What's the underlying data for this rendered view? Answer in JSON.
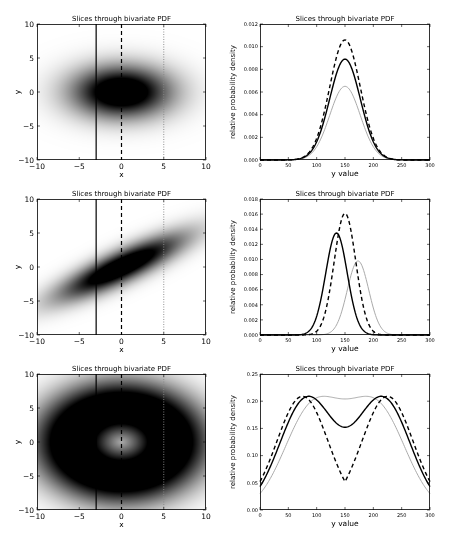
{
  "figure": {
    "width": 453,
    "height": 538,
    "rows": 3
  },
  "chart_data": [
    {
      "type": "heatmap",
      "row": 0,
      "title": "Slices through bivariate PDF",
      "xlabel": "x",
      "ylabel": "y",
      "xlim": [
        -10,
        10
      ],
      "ylim": [
        -10,
        10
      ],
      "xticks": [
        -10,
        -5,
        0,
        5,
        10
      ],
      "yticks": [
        -10,
        -5,
        0,
        5,
        10
      ],
      "distribution": "gaussian",
      "params": {
        "sx": 4.0,
        "sy": 2.6,
        "rho": 0.0
      },
      "slice_lines": [
        {
          "x": -3,
          "style": "solid",
          "color": "#000000"
        },
        {
          "x": 0,
          "style": "dashed",
          "color": "#000000"
        },
        {
          "x": 5,
          "style": "dotted",
          "color": "#888888"
        }
      ]
    },
    {
      "type": "line",
      "row": 0,
      "title": "Slices through bivariate PDF",
      "xlabel": "y value",
      "ylabel": "relative probability density",
      "xlim": [
        0,
        300
      ],
      "ylim": [
        0,
        0.012
      ],
      "xticks": [
        0,
        50,
        100,
        150,
        200,
        250,
        300
      ],
      "yticks": [
        0.0,
        0.002,
        0.004,
        0.006,
        0.008,
        0.01,
        0.012
      ],
      "ytick_labels": [
        "0.000",
        "0.002",
        "0.004",
        "0.006",
        "0.008",
        "0.010",
        "0.012"
      ],
      "series": [
        {
          "name": "slice x=-3",
          "style": "solid",
          "color": "#000000",
          "shape": "gauss",
          "peak": 0.0089,
          "center": 150,
          "sigma": 27
        },
        {
          "name": "slice x=0",
          "style": "dashed",
          "color": "#000000",
          "shape": "gauss",
          "peak": 0.0106,
          "center": 150,
          "sigma": 27
        },
        {
          "name": "slice x=5",
          "style": "solid",
          "color": "#aaaaaa",
          "shape": "gauss",
          "peak": 0.0065,
          "center": 150,
          "sigma": 27
        }
      ]
    },
    {
      "type": "heatmap",
      "row": 1,
      "title": "Slices through bivariate PDF",
      "xlabel": "x",
      "ylabel": "y",
      "xlim": [
        -10,
        10
      ],
      "ylim": [
        -10,
        10
      ],
      "xticks": [
        -10,
        -5,
        0,
        5,
        10
      ],
      "yticks": [
        -10,
        -5,
        0,
        5,
        10
      ],
      "distribution": "gaussian",
      "params": {
        "sx": 5.0,
        "sy": 3.2,
        "rho": 0.85
      },
      "slice_lines": [
        {
          "x": -3,
          "style": "solid",
          "color": "#000000"
        },
        {
          "x": 0,
          "style": "dashed",
          "color": "#000000"
        },
        {
          "x": 5,
          "style": "dotted",
          "color": "#888888"
        }
      ]
    },
    {
      "type": "line",
      "row": 1,
      "title": "Slices through bivariate PDF",
      "xlabel": "y value",
      "ylabel": "relative probability density",
      "xlim": [
        0,
        300
      ],
      "ylim": [
        0,
        0.018
      ],
      "xticks": [
        0,
        50,
        100,
        150,
        200,
        250,
        300
      ],
      "yticks": [
        0.0,
        0.002,
        0.004,
        0.006,
        0.008,
        0.01,
        0.012,
        0.014,
        0.016,
        0.018
      ],
      "ytick_labels": [
        "0.000",
        "0.002",
        "0.004",
        "0.006",
        "0.008",
        "0.010",
        "0.012",
        "0.014",
        "0.016",
        "0.018"
      ],
      "series": [
        {
          "name": "slice x=-3",
          "style": "solid",
          "color": "#000000",
          "shape": "gauss",
          "peak": 0.0135,
          "center": 135,
          "sigma": 19
        },
        {
          "name": "slice x=0",
          "style": "dashed",
          "color": "#000000",
          "shape": "gauss",
          "peak": 0.0161,
          "center": 150,
          "sigma": 19
        },
        {
          "name": "slice x=5",
          "style": "solid",
          "color": "#aaaaaa",
          "shape": "gauss",
          "peak": 0.0098,
          "center": 173,
          "sigma": 19
        }
      ]
    },
    {
      "type": "heatmap",
      "row": 2,
      "title": "Slices through bivariate PDF",
      "xlabel": "x",
      "ylabel": "y",
      "xlim": [
        -10,
        10
      ],
      "ylim": [
        -10,
        10
      ],
      "xticks": [
        -10,
        -5,
        0,
        5,
        10
      ],
      "yticks": [
        -10,
        -5,
        0,
        5,
        10
      ],
      "distribution": "ring",
      "params": {
        "r0": 5.0,
        "width": 3.0,
        "aspect": 1.15
      },
      "slice_lines": [
        {
          "x": -3,
          "style": "solid",
          "color": "#000000"
        },
        {
          "x": 0,
          "style": "dashed",
          "color": "#000000"
        },
        {
          "x": 5,
          "style": "dotted",
          "color": "#888888"
        }
      ]
    },
    {
      "type": "line",
      "row": 2,
      "title": "Slices through bivariate PDF",
      "xlabel": "y value",
      "ylabel": "relative probability density",
      "xlim": [
        0,
        300
      ],
      "ylim": [
        0,
        0.25
      ],
      "xticks": [
        0,
        50,
        100,
        150,
        200,
        250,
        300
      ],
      "yticks": [
        0.0,
        0.05,
        0.1,
        0.15,
        0.2,
        0.25
      ],
      "ytick_labels": [
        "0.00",
        "0.05",
        "0.10",
        "0.15",
        "0.20",
        "0.25"
      ],
      "series": [
        {
          "name": "slice x=-3",
          "style": "solid",
          "color": "#000000",
          "shape": "ring",
          "peak": 0.209,
          "offset": 3,
          "r0": 5.0,
          "width": 3.0
        },
        {
          "name": "slice x=0",
          "style": "dashed",
          "color": "#000000",
          "shape": "ring",
          "peak": 0.209,
          "offset": 0,
          "r0": 5.0,
          "width": 3.0
        },
        {
          "name": "slice x=5",
          "style": "solid",
          "color": "#aaaaaa",
          "shape": "ring",
          "peak": 0.209,
          "offset": 5,
          "r0": 5.0,
          "width": 3.0
        }
      ]
    }
  ]
}
